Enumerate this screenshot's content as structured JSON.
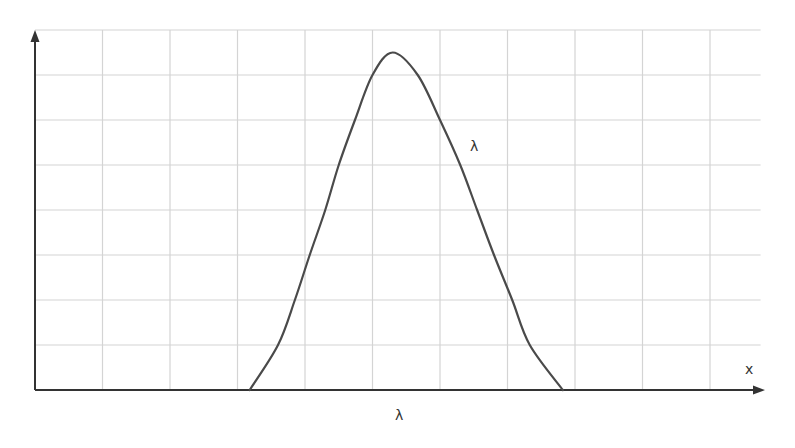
{
  "chart_data": {
    "type": "line",
    "title": "",
    "xlabel": "x",
    "ylabel": "",
    "grid": true,
    "legend": null,
    "grid_cells": {
      "x": 10.75,
      "y": 8
    },
    "xlim": [
      0,
      10.75
    ],
    "ylim": [
      0,
      8
    ],
    "tick_labels": {
      "x": [],
      "y": []
    },
    "annotations": [
      {
        "text": "λ",
        "role": "curve-label",
        "x": 6.55,
        "y": 5.3
      },
      {
        "text": "λ",
        "role": "x-axis-marker",
        "x": 5.4,
        "y": -0.57
      }
    ],
    "series": [
      {
        "name": "λ",
        "x": [
          3.18,
          3.6,
          3.85,
          4.07,
          4.3,
          4.5,
          4.74,
          5.0,
          5.3,
          5.67,
          6.0,
          6.3,
          6.55,
          6.8,
          7.07,
          7.33,
          7.82
        ],
        "y": [
          0,
          1,
          2,
          3,
          4,
          5,
          6,
          7,
          7.5,
          7,
          6,
          5,
          4,
          3,
          2,
          1,
          0
        ]
      }
    ]
  },
  "labels": {
    "axis_x": "x",
    "curve": "λ",
    "x_marker": "λ"
  },
  "colors": {
    "grid": "#d4d4d4",
    "axis": "#333333",
    "curve": "#4a4a4a",
    "background": "#ffffff"
  }
}
